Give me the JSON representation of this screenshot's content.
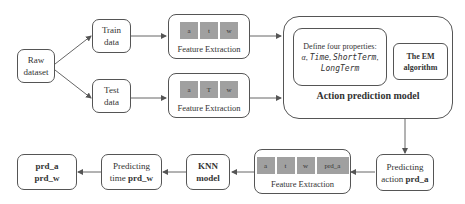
{
  "nodes": {
    "raw_dataset": {
      "line1": "Raw",
      "line2": "dataset"
    },
    "train_data": {
      "line1": "Train",
      "line2": "data"
    },
    "test_data": {
      "line1": "Test",
      "line2": "data"
    },
    "feature_extraction_train": {
      "cells": [
        "a",
        "t",
        "w"
      ],
      "caption": "Feature Extraction"
    },
    "feature_extraction_test": {
      "cells": [
        "a",
        "T",
        "w"
      ],
      "caption": "Feature Extraction"
    },
    "action_prediction_model": {
      "title": "Action prediction model",
      "define_box": {
        "line1": "Define four properties:",
        "props": [
          "α",
          "Time",
          "ShortTerm",
          "LongTerm"
        ]
      },
      "em_box": {
        "line1": "The EM",
        "line2": "algorithm"
      }
    },
    "predicting_action": {
      "line1": "Predicting",
      "line2_prefix": "action ",
      "line2_bold": "prd_a"
    },
    "feature_extraction_bottom": {
      "cells": [
        "a",
        "t",
        "w",
        "prd_a"
      ],
      "caption": "Feature Extraction"
    },
    "knn_model": {
      "line1": "KNN",
      "line2": "model"
    },
    "predicting_time": {
      "line1": "Predicting",
      "line2_prefix": "time ",
      "line2_bold": "prd_w"
    },
    "output": {
      "line1": "prd_a",
      "line2": "prd_w"
    }
  }
}
